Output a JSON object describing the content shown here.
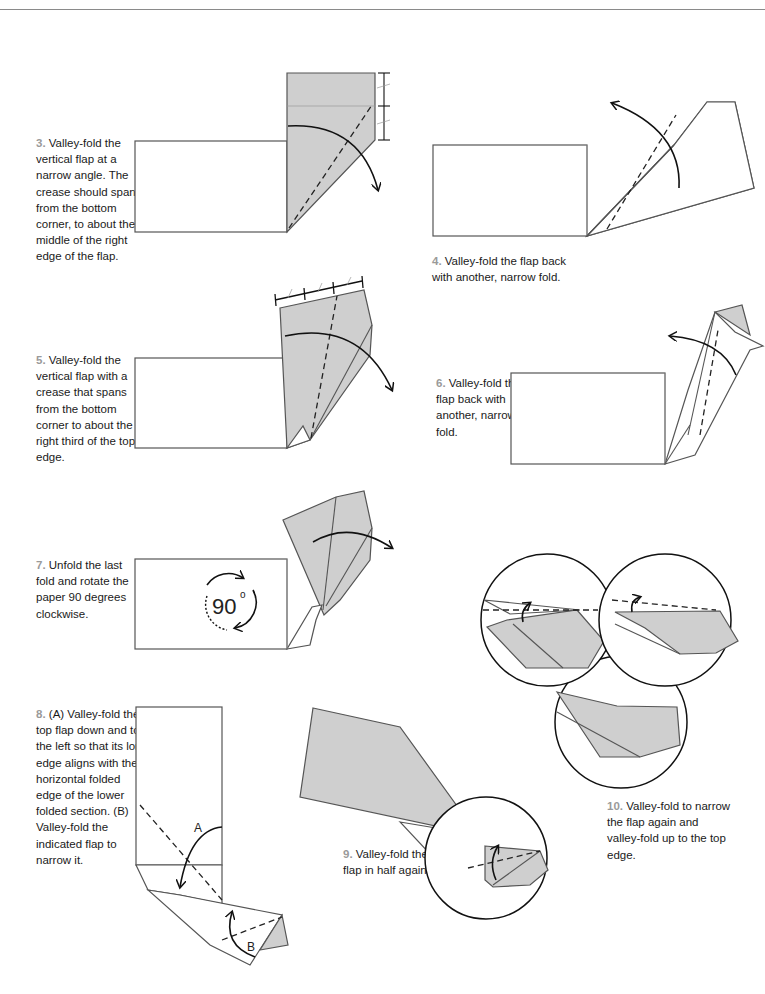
{
  "page": {
    "steps": [
      {
        "number": "3.",
        "text": "Valley-fold the vertical flap at a narrow angle. The crease should span from the bottom corner, to about the middle of the right edge of the flap."
      },
      {
        "number": "4.",
        "text": "Valley-fold the flap back with another, narrow fold."
      },
      {
        "number": "5.",
        "text": "Valley-fold the vertical flap with a crease that spans from the bottom corner to about the right third of the top edge."
      },
      {
        "number": "6.",
        "text": "Valley-fold the flap back with another, narrow fold."
      },
      {
        "number": "7.",
        "text": "Unfold the last fold and rotate the paper 90 degrees clockwise."
      },
      {
        "number": "8.",
        "text": "(A) Valley-fold the top flap down and to the left so that its long edge aligns with the horizontal folded edge of the lower folded section. (B) Valley-fold the indicated flap to narrow it."
      },
      {
        "number": "9.",
        "text": "Valley-fold the flap in half again."
      },
      {
        "number": "10.",
        "text": "Valley-fold to narrow the flap again and valley-fold up to the top edge."
      }
    ],
    "labels": {
      "rotation": "90",
      "degree_symbol": "o",
      "fold_a": "A",
      "fold_b": "B"
    },
    "colors": {
      "step_number": "#9a9a9a",
      "paper_grey": "#cfcfcf",
      "paper_white": "#ffffff",
      "line": "#555555"
    }
  }
}
